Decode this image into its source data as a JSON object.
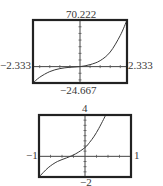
{
  "chart_data": [
    {
      "type": "line",
      "title": "",
      "xlabel": "",
      "ylabel": "",
      "xlim": [
        -2.333,
        2.333
      ],
      "ylim": [
        -24.667,
        70.222
      ],
      "grid": false,
      "axes_through_origin": true,
      "window_labels": {
        "top": "70.222",
        "bottom": "−24.667",
        "left": "−2.333",
        "right": "2.333"
      },
      "series": [
        {
          "name": "f(x)",
          "x": [
            -2.333,
            -2.0,
            -1.5,
            -1.0,
            -0.5,
            0.0,
            0.5,
            1.0,
            1.5,
            2.0,
            2.333
          ],
          "y": [
            -24.667,
            -16.0,
            -7.5,
            -3.0,
            -1.0,
            0.0,
            3.0,
            9.0,
            22.0,
            47.0,
            70.222
          ]
        }
      ]
    },
    {
      "type": "line",
      "title": "",
      "xlabel": "",
      "ylabel": "",
      "xlim": [
        -1,
        1
      ],
      "ylim": [
        -2,
        4
      ],
      "grid": false,
      "axes_through_origin": true,
      "window_labels": {
        "top": "4",
        "bottom": "−2",
        "left": "−1",
        "right": "1"
      },
      "series": [
        {
          "name": "g(x)",
          "x": [
            -1.0,
            -0.8,
            -0.6,
            -0.4,
            -0.2,
            0.0,
            0.1,
            0.2,
            0.3,
            0.4,
            0.45
          ],
          "y": [
            -2.0,
            -1.1,
            -0.5,
            -0.15,
            0.25,
            0.85,
            1.35,
            1.95,
            2.7,
            3.55,
            4.0
          ]
        }
      ]
    }
  ]
}
